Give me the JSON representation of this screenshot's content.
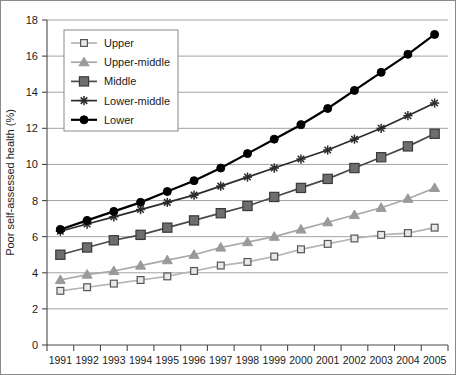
{
  "chart_data": {
    "type": "line",
    "title": "",
    "xlabel": "",
    "ylabel": "Poor self-assessed health (%)",
    "categories": [
      "1991",
      "1992",
      "1993",
      "1994",
      "1995",
      "1996",
      "1997",
      "1998",
      "1999",
      "2000",
      "2001",
      "2002",
      "2003",
      "2004",
      "2005"
    ],
    "ylim": [
      0,
      18
    ],
    "ytick_step": 2,
    "yticks": [
      "0",
      "2",
      "4",
      "6",
      "8",
      "10",
      "12",
      "14",
      "16",
      "18"
    ],
    "grid": "horizontal",
    "legend_position": "upper-left-inside",
    "series": [
      {
        "name": "Upper",
        "marker": "open-square",
        "color": "#b5b5b5",
        "marker_fill": "#e8e8e8",
        "marker_stroke": "#555555",
        "values": [
          3.0,
          3.2,
          3.4,
          3.6,
          3.8,
          4.1,
          4.4,
          4.6,
          4.9,
          5.3,
          5.6,
          5.9,
          6.1,
          6.2,
          6.5
        ]
      },
      {
        "name": "Upper-middle",
        "marker": "triangle",
        "color": "#a8a8a8",
        "marker_fill": "#9a9a9a",
        "marker_stroke": "#9a9a9a",
        "values": [
          3.6,
          3.9,
          4.1,
          4.4,
          4.7,
          5.0,
          5.4,
          5.7,
          6.0,
          6.4,
          6.8,
          7.2,
          7.6,
          8.1,
          8.7
        ]
      },
      {
        "name": "Middle",
        "marker": "filled-square",
        "color": "#4a4a4a",
        "marker_fill": "#6e6e6e",
        "marker_stroke": "#3a3a3a",
        "values": [
          5.0,
          5.4,
          5.8,
          6.1,
          6.5,
          6.9,
          7.3,
          7.7,
          8.2,
          8.7,
          9.2,
          9.8,
          10.4,
          11.0,
          11.7
        ]
      },
      {
        "name": "Lower-middle",
        "marker": "asterisk",
        "color": "#2b2b2b",
        "marker_fill": "#2b2b2b",
        "marker_stroke": "#2b2b2b",
        "values": [
          6.3,
          6.7,
          7.1,
          7.5,
          7.9,
          8.3,
          8.8,
          9.3,
          9.8,
          10.3,
          10.8,
          11.4,
          12.0,
          12.7,
          13.4
        ]
      },
      {
        "name": "Lower",
        "marker": "filled-circle",
        "color": "#000000",
        "marker_fill": "#000000",
        "marker_stroke": "#000000",
        "values": [
          6.4,
          6.9,
          7.4,
          7.9,
          8.5,
          9.1,
          9.8,
          10.6,
          11.4,
          12.2,
          13.1,
          14.1,
          15.1,
          16.1,
          17.2
        ]
      }
    ]
  },
  "axis": {
    "y_title": "Poor self-assessed health (%)"
  }
}
